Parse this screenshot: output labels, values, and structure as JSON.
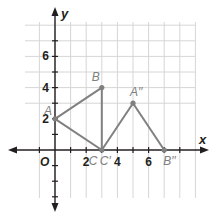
{
  "diagram": {
    "type": "coordinate-plane",
    "x_axis_label": "x",
    "y_axis_label": "y",
    "origin_label": "O",
    "x_range": [
      -2,
      7
    ],
    "y_range": [
      -3,
      8
    ],
    "x_tick_labels": [
      {
        "value": 2,
        "text": "2"
      },
      {
        "value": 4,
        "text": "4"
      },
      {
        "value": 6,
        "text": "6"
      }
    ],
    "y_tick_labels": [
      {
        "value": 2,
        "text": "2"
      },
      {
        "value": 4,
        "text": "4"
      },
      {
        "value": 6,
        "text": "6"
      }
    ],
    "points": [
      {
        "id": "A",
        "label": "A",
        "x": 0,
        "y": 2
      },
      {
        "id": "B",
        "label": "B",
        "x": 3,
        "y": 4
      },
      {
        "id": "C",
        "label": "C",
        "x": 3,
        "y": 0
      },
      {
        "id": "C2",
        "label": "C′",
        "x": 3,
        "y": 0
      },
      {
        "id": "A2",
        "label": "A′′",
        "x": 5,
        "y": 3
      },
      {
        "id": "B2",
        "label": "B′′",
        "x": 7,
        "y": 0
      }
    ],
    "segments": [
      [
        "A",
        "B"
      ],
      [
        "B",
        "C"
      ],
      [
        "C",
        "A"
      ],
      [
        "C2",
        "A2"
      ],
      [
        "A2",
        "B2"
      ]
    ],
    "colors": {
      "figure": "#808080",
      "axis": "#231f20",
      "grid": "#d6d6d6"
    }
  }
}
